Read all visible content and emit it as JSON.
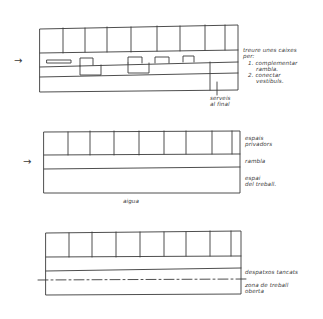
{
  "sketch1": {
    "arrow": "→",
    "notes": [
      "treure unes caixes",
      "per:",
      "1. complementar",
      "rambla.",
      "2. conectar",
      "vestíbuls."
    ],
    "callout": [
      "serveis",
      "al final"
    ]
  },
  "sketch2": {
    "arrow": "→",
    "labels": {
      "private": [
        "espais",
        "privadors"
      ],
      "rambla": "rambla",
      "shared": [
        "espai",
        "del treball."
      ]
    },
    "caption": "aigua"
  },
  "sketch3": {
    "labels": {
      "boundary": "despatxos tancats",
      "open": [
        "zona de treball",
        "oberta"
      ]
    }
  },
  "colors": {
    "ink": "#3a3a3a",
    "paper": "#ffffff"
  }
}
